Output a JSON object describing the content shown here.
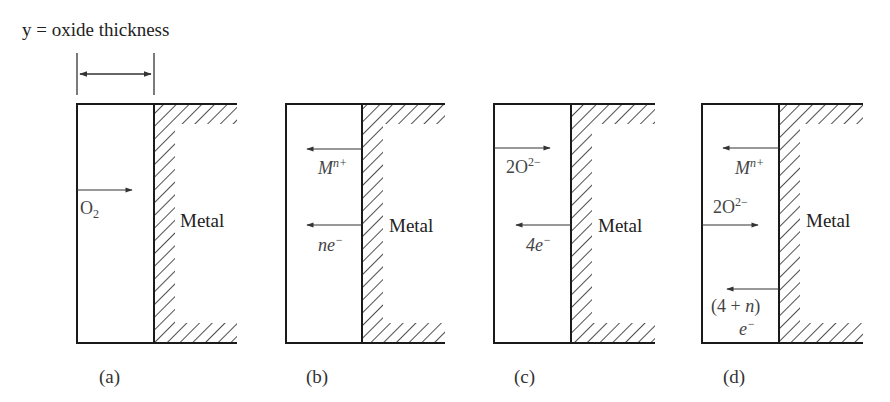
{
  "title": "y = oxide thickness",
  "metal_label": "Metal",
  "panels": [
    {
      "caption": "(a)",
      "species": [
        {
          "label_main": "O",
          "label_sub": "2",
          "direction": "right",
          "description": "O2 diffuses inward through oxide"
        }
      ]
    },
    {
      "caption": "(b)",
      "species": [
        {
          "label_main": "M",
          "label_sup": "n+",
          "direction": "left",
          "description": "Metal cations diffuse outward"
        },
        {
          "label_main": "ne",
          "label_sup": "−",
          "direction": "left",
          "description": "Electrons move outward"
        }
      ]
    },
    {
      "caption": "(c)",
      "species": [
        {
          "label_main": "2O",
          "label_sup": "2−",
          "direction": "right",
          "description": "Oxide anions diffuse inward"
        },
        {
          "label_main": "4e",
          "label_sup": "−",
          "direction": "left",
          "description": "Electrons move outward"
        }
      ]
    },
    {
      "caption": "(d)",
      "species": [
        {
          "label_main": "M",
          "label_sup": "n+",
          "direction": "left",
          "description": "Metal cations diffuse outward"
        },
        {
          "label_main": "2O",
          "label_sup": "2−",
          "direction": "right",
          "description": "Oxide anions diffuse inward"
        },
        {
          "label_main": "(4 + ",
          "label_var": "n",
          "label_close": ")",
          "label_line2": "e",
          "label_sup": "−",
          "direction": "left",
          "description": "Electrons move outward"
        }
      ]
    }
  ],
  "colors": {
    "line": "#1a1a1a",
    "arrow": "#333333",
    "text": "#333333",
    "background": "#ffffff"
  }
}
